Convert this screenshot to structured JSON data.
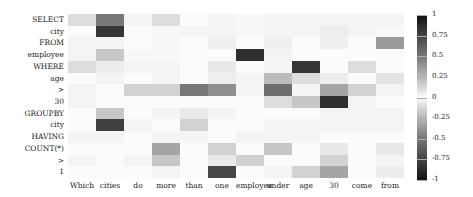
{
  "chart_data": {
    "type": "heatmap",
    "title": "",
    "xlabel": "",
    "ylabel": "",
    "x_labels": [
      "Which",
      "cities",
      "do",
      "more",
      "than",
      "one",
      "employee",
      "under",
      "age",
      "30",
      "come",
      "from"
    ],
    "y_labels": [
      "SELECT",
      "city",
      "FROM",
      "employee",
      "WHERE",
      "age",
      ">",
      "30",
      "GROUPBY",
      "city",
      "HAVING",
      "COUNT(*)",
      ">",
      "1"
    ],
    "colorbar": {
      "ticks": [
        "1",
        "0.75",
        "0.5",
        "0.25",
        "0",
        "-0.25",
        "-0.5",
        "-0.75",
        "-1"
      ],
      "range": [
        -1,
        1
      ],
      "colormap": "grayscale, dark at both extremes"
    },
    "values": [
      [
        0.15,
        0.6,
        0.05,
        0.15,
        0.02,
        0.05,
        0.03,
        0.05,
        0.05,
        0.05,
        0.05,
        0.05
      ],
      [
        0.02,
        0.9,
        0.02,
        0.03,
        0.05,
        0.05,
        0.03,
        0.05,
        0.05,
        0.08,
        0.05,
        0.03
      ],
      [
        0.05,
        0.05,
        0.02,
        0.03,
        0.02,
        0.07,
        0.02,
        0.07,
        0.02,
        0.07,
        0.02,
        0.45
      ],
      [
        0.05,
        0.25,
        0.03,
        0.03,
        0.02,
        0.02,
        0.92,
        0.05,
        0.02,
        0.02,
        0.02,
        0.02
      ],
      [
        0.15,
        0.08,
        0.05,
        0.05,
        0.02,
        0.1,
        0.02,
        0.05,
        0.9,
        0.02,
        0.15,
        0.02
      ],
      [
        0.02,
        0.05,
        0.02,
        0.05,
        0.02,
        0.08,
        0.05,
        0.3,
        0.15,
        0.08,
        0.02,
        0.12
      ],
      [
        0.05,
        0.02,
        0.2,
        0.2,
        0.6,
        0.5,
        0.05,
        0.65,
        0.05,
        0.4,
        0.2,
        0.05
      ],
      [
        0.05,
        0.02,
        0.02,
        0.02,
        0.02,
        0.02,
        0.02,
        0.15,
        0.25,
        0.92,
        0.05,
        0.02
      ],
      [
        0.02,
        0.25,
        0.02,
        0.05,
        0.1,
        0.05,
        0.02,
        0.02,
        0.02,
        0.05,
        0.05,
        0.05
      ],
      [
        0.02,
        0.85,
        0.05,
        0.02,
        0.2,
        0.02,
        0.02,
        0.05,
        0.05,
        0.05,
        0.05,
        0.05
      ],
      [
        0.05,
        0.05,
        0.02,
        0.05,
        0.05,
        0.02,
        0.05,
        0.05,
        0.05,
        0.02,
        0.02,
        0.02
      ],
      [
        0.02,
        0.02,
        0.02,
        0.4,
        0.02,
        0.2,
        0.02,
        0.25,
        0.02,
        0.1,
        0.02,
        0.1
      ],
      [
        0.05,
        0.02,
        0.05,
        0.25,
        0.02,
        0.1,
        0.2,
        0.02,
        0.02,
        0.2,
        0.02,
        0.05
      ],
      [
        0.02,
        0.02,
        0.02,
        0.05,
        0.02,
        0.82,
        0.02,
        0.05,
        0.2,
        0.4,
        0.02,
        0.08
      ]
    ]
  }
}
